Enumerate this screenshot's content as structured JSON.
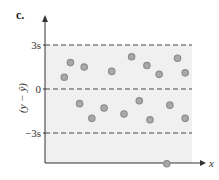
{
  "panel_label": "c.",
  "chart_data": {
    "type": "scatter",
    "title": "",
    "xlabel": "x",
    "ylabel": "(y − ŷ)",
    "yticks": [
      {
        "label": "3s",
        "value": 3
      },
      {
        "label": "0",
        "value": 0
      },
      {
        "label": "−3s",
        "value": -3
      }
    ],
    "ylim": [
      -5.4,
      4.4
    ],
    "reference_lines": [
      {
        "y": 3,
        "style": "dashed"
      },
      {
        "y": 0,
        "style": "dashed"
      },
      {
        "y": -3,
        "style": "dashed"
      }
    ],
    "grid": false,
    "points": [
      {
        "x": 1,
        "y": 0.8
      },
      {
        "x": 1.4,
        "y": 1.8
      },
      {
        "x": 2.0,
        "y": -1.0
      },
      {
        "x": 2.3,
        "y": 1.5
      },
      {
        "x": 2.8,
        "y": -2.0
      },
      {
        "x": 3.6,
        "y": -1.3
      },
      {
        "x": 4.1,
        "y": 1.2
      },
      {
        "x": 4.9,
        "y": -1.7
      },
      {
        "x": 5.4,
        "y": 2.2
      },
      {
        "x": 5.9,
        "y": -0.8
      },
      {
        "x": 6.4,
        "y": 1.6
      },
      {
        "x": 6.6,
        "y": -2.1
      },
      {
        "x": 7.2,
        "y": 1.0
      },
      {
        "x": 7.7,
        "y": -5.1
      },
      {
        "x": 7.9,
        "y": -1.1
      },
      {
        "x": 8.4,
        "y": 2.1
      },
      {
        "x": 8.9,
        "y": 1.1
      },
      {
        "x": 8.9,
        "y": -2.0
      }
    ],
    "point_style": {
      "fill": "#a9a9a9",
      "stroke": "#8c8c8c"
    },
    "colors": {
      "band_fill": "#f0f0f0",
      "axis": "#333333",
      "dash": "#444444"
    }
  }
}
